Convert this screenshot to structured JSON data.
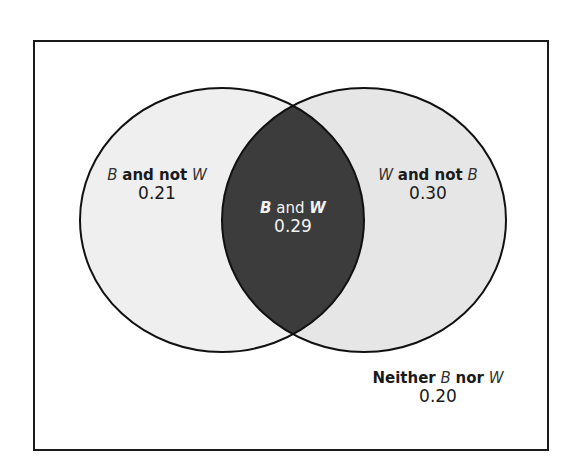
{
  "diagram": {
    "type": "venn",
    "colors": {
      "frame": "#1a1a1a",
      "left_only": "#efefef",
      "right_only": "#e6e6e6",
      "intersection": "#3c3c3c",
      "outline": "#111111"
    },
    "sets": [
      {
        "id": "B",
        "name": "B"
      },
      {
        "id": "W",
        "name": "W"
      }
    ],
    "regions": {
      "b_not_w": {
        "var1": "B",
        "conj": "and not",
        "var2": "W",
        "value": "0.21"
      },
      "b_and_w": {
        "var1": "B",
        "conj": "and",
        "var2": "W",
        "value": "0.29"
      },
      "w_not_b": {
        "var1": "W",
        "conj": "and not",
        "var2": "B",
        "value": "0.30"
      },
      "neither": {
        "prefix": "Neither",
        "var1": "B",
        "conj": "nor",
        "var2": "W",
        "value": "0.20"
      }
    }
  }
}
